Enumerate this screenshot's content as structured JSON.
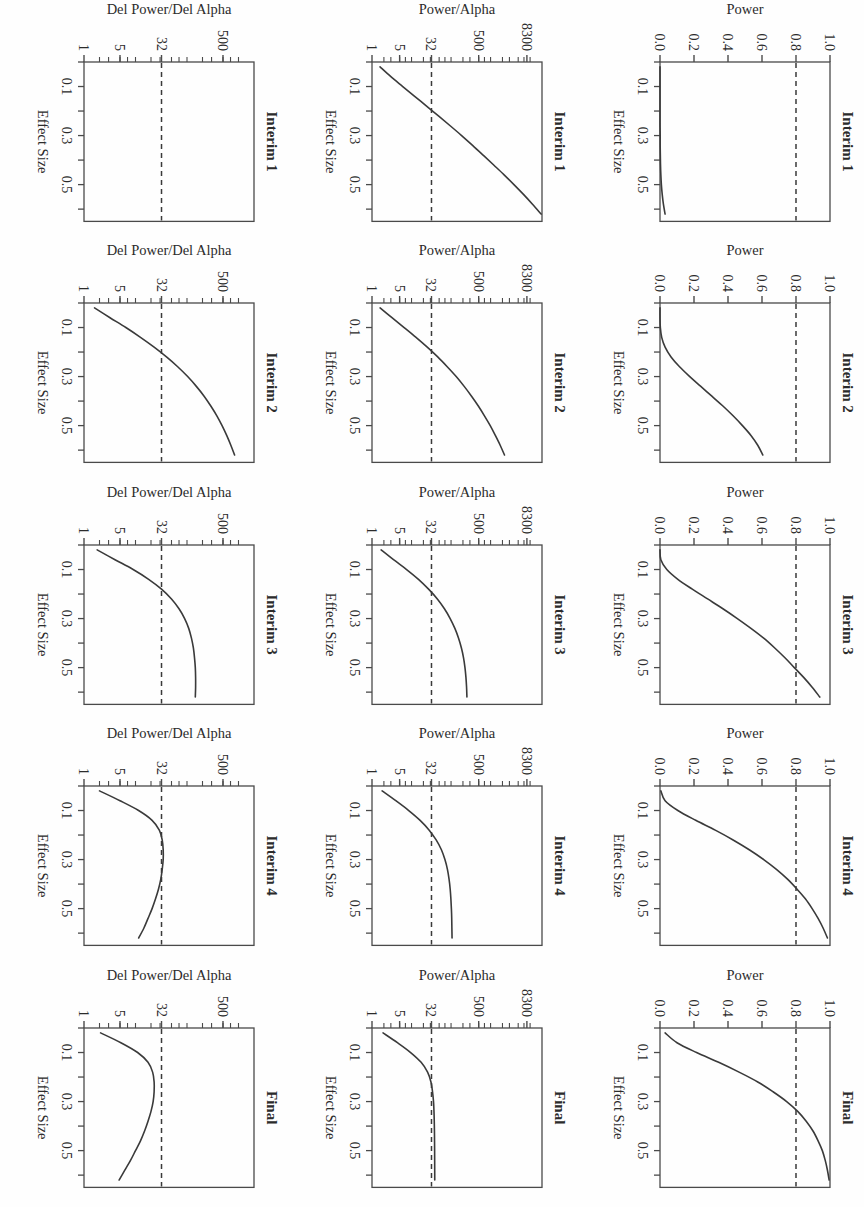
{
  "figure": {
    "columns": [
      "Interim 1",
      "Interim 2",
      "Interim 3",
      "Interim 4",
      "Final"
    ],
    "rows": [
      "Power",
      "Power/Alpha",
      "Del Power/Del Alpha"
    ],
    "xlabel": "Effect Size",
    "orientation_degrees": 90,
    "line_color": "#3a3a3a",
    "dash_color": "#3a3a3a",
    "axis_color": "#4a4a4a",
    "background": "#fefefe"
  },
  "chart_data": [
    {
      "type": "line",
      "title": "Interim 1",
      "xlabel": "Effect Size",
      "ylabel": "Power",
      "xticks": [
        0.1,
        0.3,
        0.5
      ],
      "xticklabels": [
        "0.1",
        "0.3",
        "0.5"
      ],
      "xlim": [
        0.0,
        0.65
      ],
      "yticks": [
        0.0,
        0.2,
        0.4,
        0.6,
        0.8,
        1.0
      ],
      "yticklabels": [
        "0.0",
        "0.2",
        "0.4",
        "0.6",
        "0.8",
        "1.0"
      ],
      "ylim": [
        0.0,
        1.0
      ],
      "scale": "linear",
      "hline": 0.8,
      "hline_style": "dashed",
      "grid": false,
      "legend": "none",
      "x": [
        0.02,
        0.06,
        0.1,
        0.14,
        0.18,
        0.22,
        0.26,
        0.3,
        0.34,
        0.38,
        0.42,
        0.46,
        0.5,
        0.54,
        0.58,
        0.62
      ],
      "y": [
        0.0,
        0.0,
        0.0,
        0.0,
        0.0,
        0.0,
        0.0,
        0.001,
        0.001,
        0.002,
        0.003,
        0.005,
        0.008,
        0.013,
        0.02,
        0.03
      ]
    },
    {
      "type": "line",
      "title": "Interim 2",
      "xlabel": "Effect Size",
      "ylabel": "Power",
      "xticks": [
        0.1,
        0.3,
        0.5
      ],
      "xticklabels": [
        "0.1",
        "0.3",
        "0.5"
      ],
      "xlim": [
        0.0,
        0.65
      ],
      "yticks": [
        0.0,
        0.2,
        0.4,
        0.6,
        0.8,
        1.0
      ],
      "yticklabels": [
        "0.0",
        "0.2",
        "0.4",
        "0.6",
        "0.8",
        "1.0"
      ],
      "ylim": [
        0.0,
        1.0
      ],
      "scale": "linear",
      "hline": 0.8,
      "hline_style": "dashed",
      "grid": false,
      "legend": "none",
      "x": [
        0.02,
        0.06,
        0.1,
        0.14,
        0.18,
        0.22,
        0.26,
        0.3,
        0.34,
        0.38,
        0.42,
        0.46,
        0.5,
        0.54,
        0.58,
        0.62
      ],
      "y": [
        0.0,
        0.0,
        0.002,
        0.01,
        0.03,
        0.065,
        0.115,
        0.175,
        0.24,
        0.305,
        0.37,
        0.43,
        0.485,
        0.535,
        0.575,
        0.605
      ]
    },
    {
      "type": "line",
      "title": "Interim 3",
      "xlabel": "Effect Size",
      "ylabel": "Power",
      "xticks": [
        0.1,
        0.3,
        0.5
      ],
      "xticklabels": [
        "0.1",
        "0.3",
        "0.5"
      ],
      "xlim": [
        0.0,
        0.65
      ],
      "yticks": [
        0.0,
        0.2,
        0.4,
        0.6,
        0.8,
        1.0
      ],
      "yticklabels": [
        "0.0",
        "0.2",
        "0.4",
        "0.6",
        "0.8",
        "1.0"
      ],
      "ylim": [
        0.0,
        1.0
      ],
      "scale": "linear",
      "hline": 0.8,
      "hline_style": "dashed",
      "grid": false,
      "legend": "none",
      "x": [
        0.02,
        0.06,
        0.1,
        0.14,
        0.18,
        0.22,
        0.26,
        0.3,
        0.34,
        0.38,
        0.42,
        0.46,
        0.5,
        0.54,
        0.58,
        0.62
      ],
      "y": [
        0.0,
        0.005,
        0.04,
        0.105,
        0.19,
        0.28,
        0.37,
        0.455,
        0.535,
        0.61,
        0.675,
        0.735,
        0.79,
        0.845,
        0.895,
        0.94
      ]
    },
    {
      "type": "line",
      "title": "Interim 4",
      "xlabel": "Effect Size",
      "ylabel": "Power",
      "xticks": [
        0.1,
        0.3,
        0.5
      ],
      "xticklabels": [
        "0.1",
        "0.3",
        "0.5"
      ],
      "xlim": [
        0.0,
        0.65
      ],
      "yticks": [
        0.0,
        0.2,
        0.4,
        0.6,
        0.8,
        1.0
      ],
      "yticklabels": [
        "0.0",
        "0.2",
        "0.4",
        "0.6",
        "0.8",
        "1.0"
      ],
      "ylim": [
        0.0,
        1.0
      ],
      "scale": "linear",
      "hline": 0.8,
      "hline_style": "dashed",
      "grid": false,
      "legend": "none",
      "x": [
        0.02,
        0.06,
        0.1,
        0.14,
        0.18,
        0.22,
        0.26,
        0.3,
        0.34,
        0.38,
        0.42,
        0.46,
        0.5,
        0.54,
        0.58,
        0.62
      ],
      "y": [
        0.005,
        0.03,
        0.105,
        0.21,
        0.325,
        0.43,
        0.525,
        0.61,
        0.685,
        0.75,
        0.805,
        0.855,
        0.895,
        0.93,
        0.96,
        0.985
      ]
    },
    {
      "type": "line",
      "title": "Final",
      "xlabel": "Effect Size",
      "ylabel": "Power",
      "xticks": [
        0.1,
        0.3,
        0.5
      ],
      "xticklabels": [
        "0.1",
        "0.3",
        "0.5"
      ],
      "xlim": [
        0.0,
        0.65
      ],
      "yticks": [
        0.0,
        0.2,
        0.4,
        0.6,
        0.8,
        1.0
      ],
      "yticklabels": [
        "0.0",
        "0.2",
        "0.4",
        "0.6",
        "0.8",
        "1.0"
      ],
      "ylim": [
        0.0,
        1.0
      ],
      "scale": "linear",
      "hline": 0.8,
      "hline_style": "dashed",
      "grid": false,
      "legend": "none",
      "x": [
        0.02,
        0.06,
        0.1,
        0.14,
        0.18,
        0.22,
        0.26,
        0.3,
        0.34,
        0.38,
        0.42,
        0.46,
        0.5,
        0.54,
        0.58,
        0.62
      ],
      "y": [
        0.03,
        0.1,
        0.215,
        0.345,
        0.465,
        0.575,
        0.665,
        0.745,
        0.81,
        0.86,
        0.9,
        0.93,
        0.955,
        0.972,
        0.985,
        0.995
      ]
    },
    {
      "type": "line",
      "title": "Interim 1",
      "xlabel": "Effect Size",
      "ylabel": "Power/Alpha",
      "xticks": [
        0.1,
        0.3,
        0.5
      ],
      "xticklabels": [
        "0.1",
        "0.3",
        "0.5"
      ],
      "xlim": [
        0.0,
        0.65
      ],
      "yticks": [
        1,
        5,
        32,
        500,
        8300
      ],
      "yticklabels": [
        "1",
        "5",
        "32",
        "500",
        "8300"
      ],
      "ylim": [
        1,
        20000
      ],
      "scale": "log",
      "hline": 32,
      "hline_style": "dashed",
      "grid": false,
      "legend": "none",
      "x": [
        0.02,
        0.06,
        0.1,
        0.14,
        0.18,
        0.22,
        0.26,
        0.3,
        0.34,
        0.38,
        0.42,
        0.46,
        0.5,
        0.54,
        0.58,
        0.62
      ],
      "y": [
        1.6,
        3.0,
        6.0,
        12.0,
        24.0,
        48.0,
        95.0,
        185.0,
        350.0,
        650.0,
        1200.0,
        2200.0,
        3900.0,
        6800.0,
        11500.0,
        19000.0
      ]
    },
    {
      "type": "line",
      "title": "Interim 2",
      "xlabel": "Effect Size",
      "ylabel": "Power/Alpha",
      "xticks": [
        0.1,
        0.3,
        0.5
      ],
      "xticklabels": [
        "0.1",
        "0.3",
        "0.5"
      ],
      "xlim": [
        0.0,
        0.65
      ],
      "yticks": [
        1,
        5,
        32,
        500,
        8300
      ],
      "yticklabels": [
        "1",
        "5",
        "32",
        "500",
        "8300"
      ],
      "ylim": [
        1,
        20000
      ],
      "scale": "log",
      "hline": 32,
      "hline_style": "dashed",
      "grid": false,
      "legend": "none",
      "x": [
        0.02,
        0.06,
        0.1,
        0.14,
        0.18,
        0.22,
        0.26,
        0.3,
        0.34,
        0.38,
        0.42,
        0.46,
        0.5,
        0.54,
        0.58,
        0.62
      ],
      "y": [
        1.6,
        3.2,
        6.5,
        13.0,
        25.0,
        46.0,
        80.0,
        135.0,
        215.0,
        330.0,
        490.0,
        700.0,
        980.0,
        1320.0,
        1750.0,
        2250.0
      ]
    },
    {
      "type": "line",
      "title": "Interim 3",
      "xlabel": "Effect Size",
      "ylabel": "Power/Alpha",
      "xticks": [
        0.1,
        0.3,
        0.5
      ],
      "xticklabels": [
        "0.1",
        "0.3",
        "0.5"
      ],
      "xlim": [
        0.0,
        0.65
      ],
      "yticks": [
        1,
        5,
        32,
        500,
        8300
      ],
      "yticklabels": [
        "1",
        "5",
        "32",
        "500",
        "8300"
      ],
      "ylim": [
        1,
        20000
      ],
      "scale": "log",
      "hline": 32,
      "hline_style": "dashed",
      "grid": false,
      "legend": "none",
      "x": [
        0.02,
        0.06,
        0.1,
        0.14,
        0.18,
        0.22,
        0.26,
        0.3,
        0.34,
        0.38,
        0.42,
        0.46,
        0.5,
        0.54,
        0.58,
        0.62
      ],
      "y": [
        1.7,
        3.5,
        7.5,
        15.0,
        27.0,
        45.0,
        68.0,
        95.0,
        125.0,
        155.0,
        183.0,
        207.0,
        225.0,
        238.0,
        247.0,
        252.0
      ]
    },
    {
      "type": "line",
      "title": "Interim 4",
      "xlabel": "Effect Size",
      "ylabel": "Power/Alpha",
      "xticks": [
        0.1,
        0.3,
        0.5
      ],
      "xticklabels": [
        "0.1",
        "0.3",
        "0.5"
      ],
      "xlim": [
        0.0,
        0.65
      ],
      "yticks": [
        1,
        5,
        32,
        500,
        8300
      ],
      "yticklabels": [
        "1",
        "5",
        "32",
        "500",
        "8300"
      ],
      "ylim": [
        1,
        20000
      ],
      "scale": "log",
      "hline": 32,
      "hline_style": "dashed",
      "grid": false,
      "legend": "none",
      "x": [
        0.02,
        0.06,
        0.1,
        0.14,
        0.18,
        0.22,
        0.26,
        0.3,
        0.34,
        0.38,
        0.42,
        0.46,
        0.5,
        0.54,
        0.58,
        0.62
      ],
      "y": [
        1.8,
        4.0,
        8.5,
        16.5,
        28.0,
        42.0,
        57.0,
        70.0,
        81.0,
        89.0,
        95.0,
        99.0,
        102.0,
        104.0,
        105.0,
        106.0
      ]
    },
    {
      "type": "line",
      "title": "Final",
      "xlabel": "Effect Size",
      "ylabel": "Power/Alpha",
      "xticks": [
        0.1,
        0.3,
        0.5
      ],
      "xticklabels": [
        "0.1",
        "0.3",
        "0.5"
      ],
      "xlim": [
        0.0,
        0.65
      ],
      "yticks": [
        1,
        5,
        32,
        500,
        8300
      ],
      "yticklabels": [
        "1",
        "5",
        "32",
        "500",
        "8300"
      ],
      "ylim": [
        1,
        20000
      ],
      "scale": "log",
      "hline": 32,
      "hline_style": "dashed",
      "grid": false,
      "legend": "none",
      "x": [
        0.02,
        0.06,
        0.1,
        0.14,
        0.18,
        0.22,
        0.26,
        0.3,
        0.34,
        0.38,
        0.42,
        0.46,
        0.5,
        0.54,
        0.58,
        0.62
      ],
      "y": [
        1.9,
        4.4,
        9.5,
        17.5,
        25.5,
        31.0,
        34.0,
        36.0,
        37.0,
        37.6,
        38.0,
        38.2,
        38.4,
        38.5,
        38.6,
        38.7
      ]
    },
    {
      "type": "line",
      "title": "Interim 1",
      "xlabel": "Effect Size",
      "ylabel": "Del Power/Del Alpha",
      "xticks": [
        0.1,
        0.3,
        0.5
      ],
      "xticklabels": [
        "0.1",
        "0.3",
        "0.5"
      ],
      "xlim": [
        0.0,
        0.65
      ],
      "yticks": [
        1,
        5,
        32,
        500
      ],
      "yticklabels": [
        "1",
        "5",
        "32",
        "500"
      ],
      "ylim": [
        1,
        2000
      ],
      "scale": "log",
      "hline": 32,
      "hline_style": "dashed",
      "grid": false,
      "legend": "none",
      "x": [],
      "y": []
    },
    {
      "type": "line",
      "title": "Interim 2",
      "xlabel": "Effect Size",
      "ylabel": "Del Power/Del Alpha",
      "xticks": [
        0.1,
        0.3,
        0.5
      ],
      "xticklabels": [
        "0.1",
        "0.3",
        "0.5"
      ],
      "xlim": [
        0.0,
        0.65
      ],
      "yticks": [
        1,
        5,
        32,
        500
      ],
      "yticklabels": [
        "1",
        "5",
        "32",
        "500"
      ],
      "ylim": [
        1,
        2000
      ],
      "scale": "log",
      "hline": 32,
      "hline_style": "dashed",
      "grid": false,
      "legend": "none",
      "x": [
        0.02,
        0.06,
        0.1,
        0.14,
        0.18,
        0.22,
        0.26,
        0.3,
        0.34,
        0.38,
        0.42,
        0.46,
        0.5,
        0.54,
        0.58,
        0.62
      ],
      "y": [
        1.6,
        3.2,
        6.5,
        12.5,
        23.0,
        40.0,
        66.0,
        103.0,
        152.0,
        215.0,
        290.0,
        380.0,
        480.0,
        590.0,
        710.0,
        840.0
      ]
    },
    {
      "type": "line",
      "title": "Interim 3",
      "xlabel": "Effect Size",
      "ylabel": "Del Power/Del Alpha",
      "xticks": [
        0.1,
        0.3,
        0.5
      ],
      "xticklabels": [
        "0.1",
        "0.3",
        "0.5"
      ],
      "xlim": [
        0.0,
        0.65
      ],
      "yticks": [
        1,
        5,
        32,
        500
      ],
      "yticklabels": [
        "1",
        "5",
        "32",
        "500"
      ],
      "ylim": [
        1,
        2000
      ],
      "scale": "log",
      "hline": 32,
      "hline_style": "dashed",
      "grid": false,
      "legend": "none",
      "x": [
        0.02,
        0.06,
        0.1,
        0.14,
        0.18,
        0.22,
        0.26,
        0.3,
        0.34,
        0.38,
        0.42,
        0.46,
        0.5,
        0.54,
        0.58,
        0.62
      ],
      "y": [
        1.8,
        4.0,
        9.0,
        18.0,
        32.0,
        50.0,
        70.0,
        90.0,
        108.0,
        122.0,
        133.0,
        140.0,
        145.0,
        147.0,
        147.0,
        145.0
      ]
    },
    {
      "type": "line",
      "title": "Interim 4",
      "xlabel": "Effect Size",
      "ylabel": "Del Power/Del Alpha",
      "xticks": [
        0.1,
        0.3,
        0.5
      ],
      "xticklabels": [
        "0.1",
        "0.3",
        "0.5"
      ],
      "xlim": [
        0.0,
        0.65
      ],
      "yticks": [
        1,
        5,
        32,
        500
      ],
      "yticklabels": [
        "1",
        "5",
        "32",
        "500"
      ],
      "ylim": [
        1,
        2000
      ],
      "scale": "log",
      "hline": 32,
      "hline_style": "dashed",
      "grid": false,
      "legend": "none",
      "x": [
        0.02,
        0.06,
        0.1,
        0.14,
        0.18,
        0.22,
        0.26,
        0.3,
        0.34,
        0.38,
        0.42,
        0.46,
        0.5,
        0.54,
        0.58,
        0.62
      ],
      "y": [
        2.0,
        5.0,
        11.5,
        21.0,
        29.0,
        33.0,
        34.5,
        34.5,
        33.0,
        31.0,
        28.0,
        24.5,
        21.0,
        17.5,
        14.5,
        11.5
      ]
    },
    {
      "type": "line",
      "title": "Final",
      "xlabel": "Effect Size",
      "ylabel": "Del Power/Del Alpha",
      "xticks": [
        0.1,
        0.3,
        0.5
      ],
      "xticklabels": [
        "0.1",
        "0.3",
        "0.5"
      ],
      "xlim": [
        0.0,
        0.65
      ],
      "yticks": [
        1,
        5,
        32,
        500
      ],
      "yticklabels": [
        "1",
        "5",
        "32",
        "500"
      ],
      "ylim": [
        1,
        2000
      ],
      "scale": "log",
      "hline": 32,
      "hline_style": "dashed",
      "grid": false,
      "legend": "none",
      "x": [
        0.02,
        0.06,
        0.1,
        0.14,
        0.18,
        0.22,
        0.26,
        0.3,
        0.34,
        0.38,
        0.42,
        0.46,
        0.5,
        0.54,
        0.58,
        0.62
      ],
      "y": [
        2.1,
        5.2,
        11.0,
        17.5,
        21.5,
        23.0,
        23.0,
        22.0,
        20.0,
        17.5,
        15.0,
        12.5,
        10.0,
        8.0,
        6.2,
        4.8
      ]
    }
  ]
}
